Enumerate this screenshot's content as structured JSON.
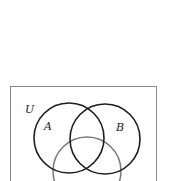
{
  "diagram": {
    "type": "venn",
    "universe_label": "U",
    "sets": [
      {
        "label": "A",
        "color": "#1e1e1e"
      },
      {
        "label": "B",
        "color": "#1e1e1e"
      },
      {
        "label": "",
        "color": "#7a7a7a"
      }
    ],
    "border_color": "#8a8a8a"
  }
}
